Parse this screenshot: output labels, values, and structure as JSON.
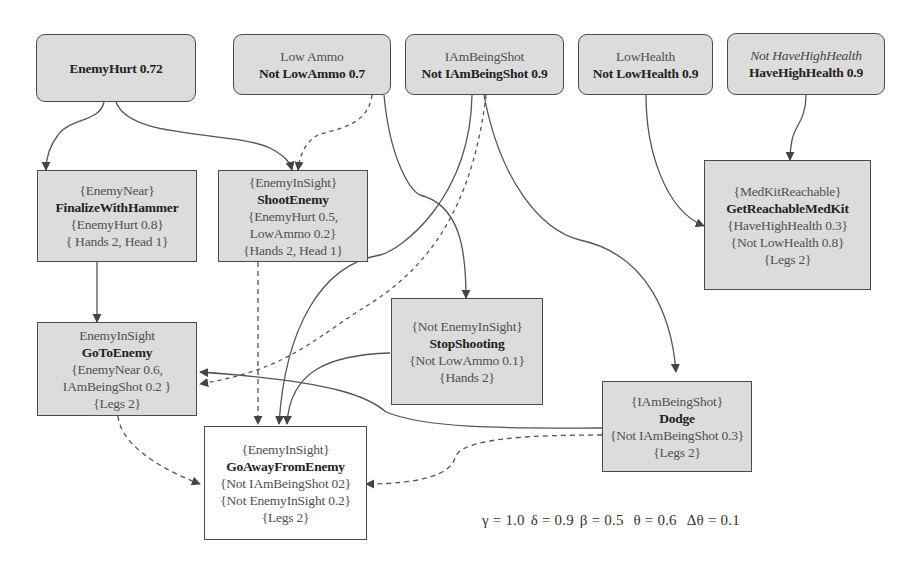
{
  "diagram": {
    "state_nodes": [
      {
        "id": "enemy-hurt",
        "lines": [
          {
            "text": "EnemyHurt 0.72",
            "style": "bold"
          }
        ]
      },
      {
        "id": "low-ammo",
        "lines": [
          {
            "text": "Low Ammo",
            "style": "normal"
          },
          {
            "text": "Not LowAmmo 0.7",
            "style": "bold"
          }
        ]
      },
      {
        "id": "i-am-being-shot",
        "lines": [
          {
            "text": "IAmBeingShot",
            "style": "normal"
          },
          {
            "text": "Not IAmBeingShot 0.9",
            "style": "bold"
          }
        ]
      },
      {
        "id": "low-health",
        "lines": [
          {
            "text": "LowHealth",
            "style": "normal"
          },
          {
            "text": "Not LowHealth 0.9",
            "style": "bold"
          }
        ]
      },
      {
        "id": "have-high-health",
        "lines": [
          {
            "text": "Not HaveHighHealth",
            "style": "italic"
          },
          {
            "text": "HaveHighHealth 0.9",
            "style": "bold"
          }
        ]
      }
    ],
    "action_nodes": [
      {
        "id": "finalize-with-hammer",
        "lines": [
          "{EnemyNear}",
          "FinalizeWithHammer",
          "{EnemyHurt 0.8}",
          "{ Hands 2, Head 1}"
        ]
      },
      {
        "id": "shoot-enemy",
        "lines": [
          "{EnemyInSight}",
          "ShootEnemy",
          "{EnemyHurt 0.5,",
          "LowAmmo 0.2}",
          "{Hands 2, Head 1}"
        ]
      },
      {
        "id": "get-reachable-medkit",
        "lines": [
          "{MedKitReachable}",
          "GetReachableMedKit",
          "{HaveHighHealth 0.3}",
          "{Not LowHealth 0.8}",
          "{Legs 2}"
        ]
      },
      {
        "id": "go-to-enemy",
        "lines": [
          "EnemyInSight",
          "GoToEnemy",
          "{EnemyNear 0.6,",
          "IAmBeingShot 0.2 }",
          "{Legs 2}"
        ]
      },
      {
        "id": "stop-shooting",
        "lines": [
          "{Not EnemyInSight}",
          "StopShooting",
          "{Not LowAmmo 0.1}",
          "{Hands 2}"
        ]
      },
      {
        "id": "dodge",
        "lines": [
          "{IAmBeingShot}",
          "Dodge",
          "{Not IAmBeingShot 0.3}",
          "{Legs 2}"
        ]
      },
      {
        "id": "go-away-from-enemy",
        "lines": [
          "{EnemyInSight}",
          "GoAwayFromEnemy",
          "{Not IAmBeingShot 02}",
          "{Not EnemyInSight 0.2}",
          "{Legs 2}"
        ]
      }
    ],
    "edges": [
      {
        "from": "enemy-hurt",
        "to": "finalize-with-hammer",
        "style": "solid"
      },
      {
        "from": "enemy-hurt",
        "to": "shoot-enemy",
        "style": "solid"
      },
      {
        "from": "low-ammo",
        "to": "shoot-enemy",
        "style": "dashed"
      },
      {
        "from": "low-ammo",
        "to": "stop-shooting",
        "style": "solid"
      },
      {
        "from": "i-am-being-shot",
        "to": "go-away-from-enemy",
        "style": "solid"
      },
      {
        "from": "i-am-being-shot",
        "to": "go-to-enemy",
        "style": "dashed"
      },
      {
        "from": "i-am-being-shot",
        "to": "dodge",
        "style": "solid"
      },
      {
        "from": "low-health",
        "to": "get-reachable-medkit",
        "style": "solid"
      },
      {
        "from": "have-high-health",
        "to": "get-reachable-medkit",
        "style": "solid"
      },
      {
        "from": "finalize-with-hammer",
        "to": "go-to-enemy",
        "style": "solid"
      },
      {
        "from": "shoot-enemy",
        "to": "go-away-from-enemy",
        "style": "dashed"
      },
      {
        "from": "stop-shooting",
        "to": "go-away-from-enemy",
        "style": "solid"
      },
      {
        "from": "dodge",
        "to": "go-to-enemy",
        "style": "solid"
      },
      {
        "from": "dodge",
        "to": "go-away-from-enemy",
        "style": "dashed"
      },
      {
        "from": "go-to-enemy",
        "to": "go-away-from-enemy",
        "style": "dashed"
      }
    ],
    "parameters": {
      "gamma": "γ = 1.0",
      "delta": "δ = 0.9",
      "beta": "β = 0.5",
      "theta": "θ = 0.6",
      "delta_theta": "Δθ = 0.1"
    },
    "colors": {
      "node_fill": "#dcdcdc",
      "node_border": "#4a4a4a",
      "edge": "#555555",
      "highlight_node_fill": "#ffffff"
    }
  }
}
